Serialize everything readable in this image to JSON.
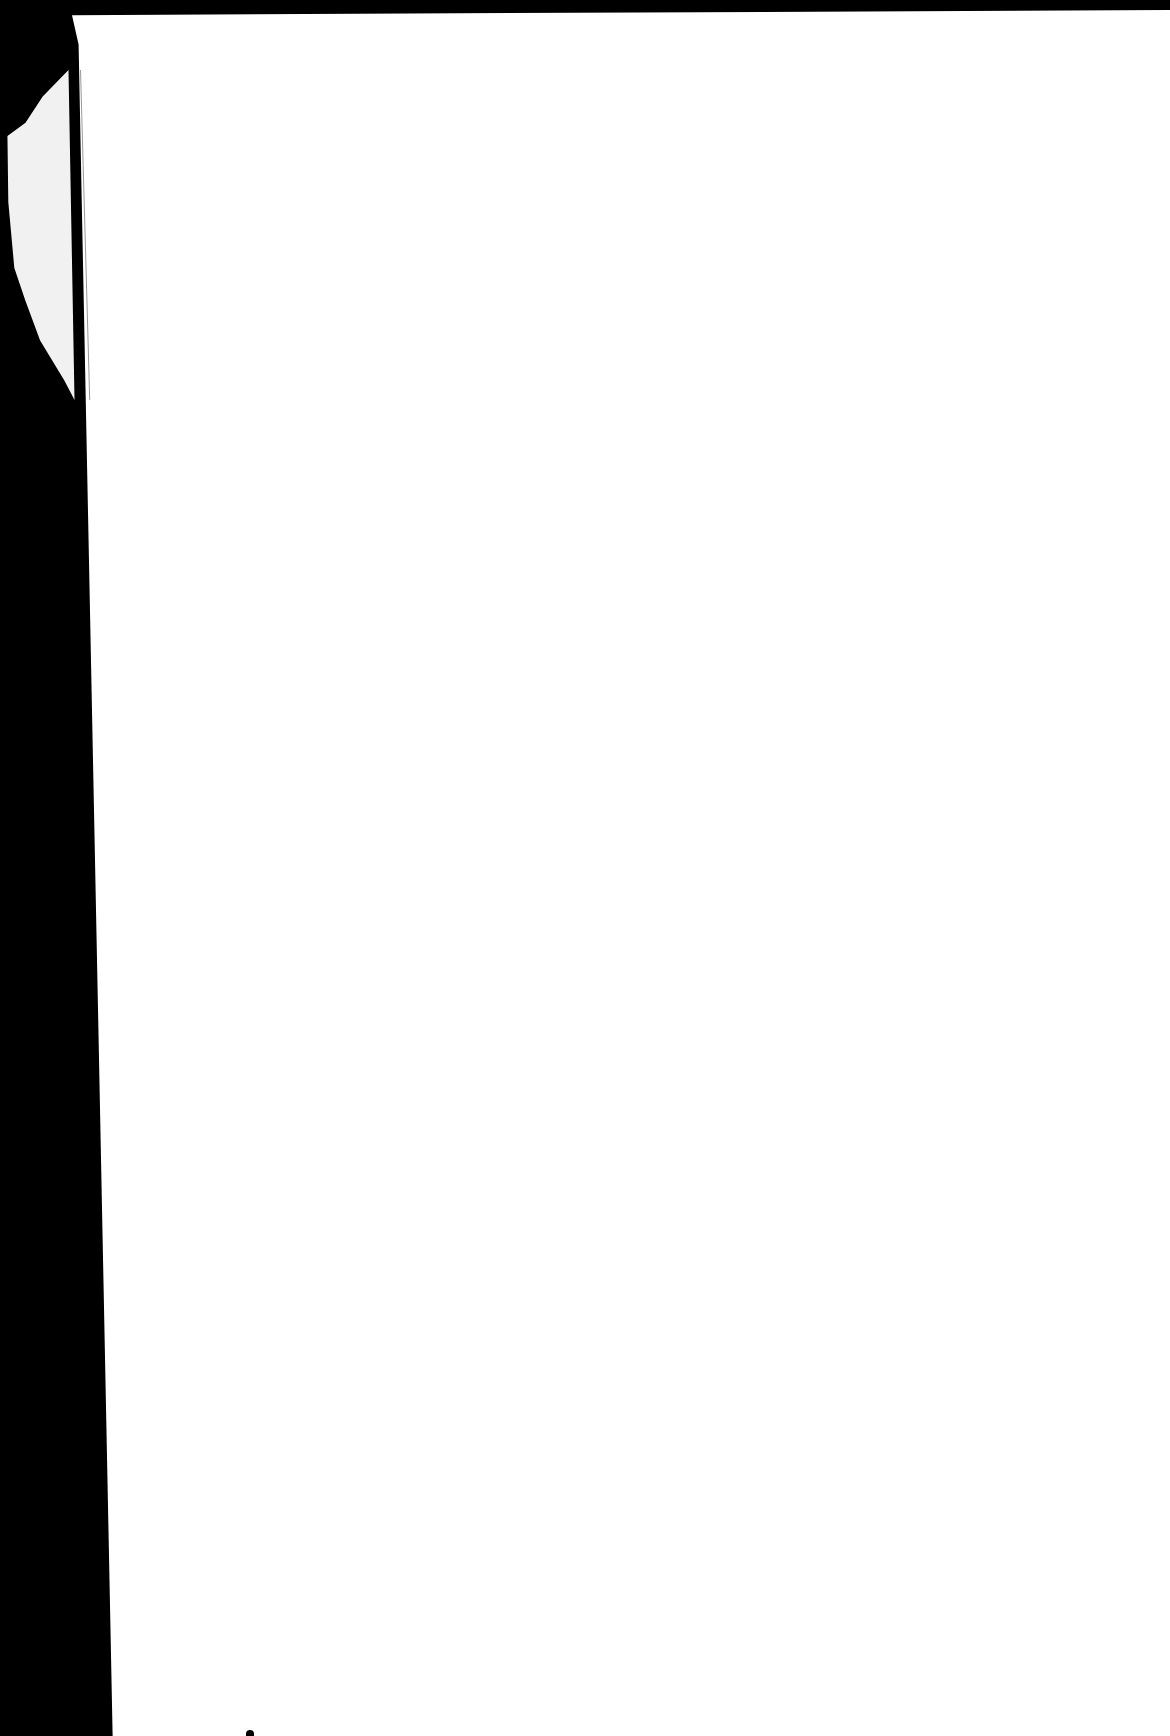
{
  "document": {
    "type": "scanned-page",
    "content": "",
    "colors": {
      "page": "#ffffff",
      "background": "#000000",
      "torn_fragment": "#f1f1f1"
    }
  }
}
